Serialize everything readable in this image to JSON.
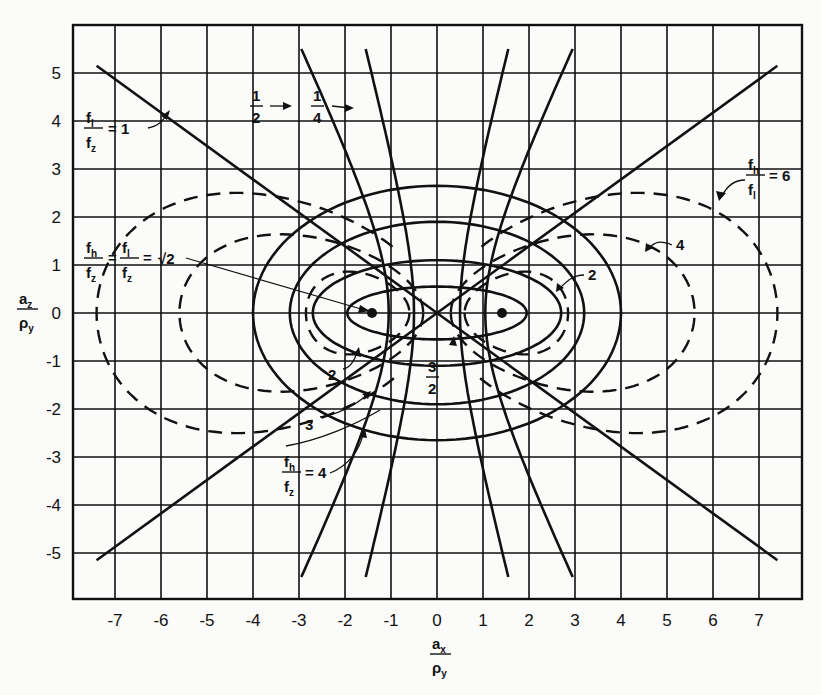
{
  "chart_data": {
    "type": "line",
    "title": "",
    "xlabel": "a_x / ρ_y",
    "ylabel": "a_z / ρ_y",
    "xlim": [
      -7.8,
      7.8
    ],
    "ylim": [
      -6,
      6
    ],
    "grid": true,
    "x_ticks": [
      "-7",
      "-6",
      "-5",
      "-4",
      "-3",
      "-2",
      "-1",
      "0",
      "1",
      "2",
      "3",
      "4",
      "5",
      "6",
      "7"
    ],
    "y_ticks": [
      "5",
      "4",
      "3",
      "2",
      "1",
      "0",
      "-1",
      "-2",
      "-3",
      "-4",
      "-5"
    ],
    "foci": [
      [
        -1.414,
        0
      ],
      [
        1.414,
        0
      ]
    ],
    "series": [
      {
        "name": "f_l/f_z = 1",
        "style": "solid",
        "kind": "line-pair",
        "points": [
          [
            -7.4,
            5.15
          ],
          [
            7.4,
            -5.15
          ]
        ],
        "mirror_points": [
          [
            -7.4,
            -5.15
          ],
          [
            7.4,
            5.15
          ]
        ]
      },
      {
        "name": "f_l/f_z = 1/2",
        "style": "solid",
        "kind": "hyperbola",
        "vertex_x": 1.05,
        "ends": [
          [
            -2.95,
            5.5
          ],
          [
            2.95,
            -5.5
          ]
        ]
      },
      {
        "name": "f_l/f_z = 1/4",
        "style": "solid",
        "kind": "hyperbola",
        "vertex_x": 0.5,
        "ends": [
          [
            -1.55,
            5.5
          ],
          [
            1.5,
            -5.5
          ]
        ]
      },
      {
        "name": "f_h/f_z = 3/2",
        "style": "solid",
        "kind": "ellipse",
        "a": 1.95,
        "b": 0.55
      },
      {
        "name": "f_h/f_z = 2",
        "style": "solid",
        "kind": "ellipse",
        "a": 2.7,
        "b": 1.1
      },
      {
        "name": "f_h/f_z = 3",
        "style": "solid",
        "kind": "ellipse",
        "a": 3.2,
        "b": 1.9
      },
      {
        "name": "f_h/f_z = 4",
        "style": "solid",
        "kind": "ellipse",
        "a": 4.0,
        "b": 2.65
      },
      {
        "name": "f_h/f_l = 2",
        "style": "dashed",
        "kind": "loop-pair",
        "inner_x": 0.6,
        "outer_x": 2.85,
        "half_height": 1.0
      },
      {
        "name": "f_h/f_l = 4",
        "style": "dashed",
        "kind": "loop-pair",
        "inner_x": 0.3,
        "outer_x": 5.6,
        "half_height": 1.9
      },
      {
        "name": "f_h/f_l = 6",
        "style": "dashed",
        "kind": "arc-pair",
        "inner_x": 0.1,
        "outer_x": 7.4,
        "half_height": 2.9
      }
    ],
    "annotations": [
      {
        "text": "f_l/f_z = 1",
        "x": -6.8,
        "y": 4.0
      },
      {
        "text": "1/2",
        "x": -2.6,
        "y": 4.0
      },
      {
        "text": "1/4",
        "x": -1.3,
        "y": 4.0
      },
      {
        "text": "f_h/f_l = 6",
        "x": 6.2,
        "y": 3.0
      },
      {
        "text": "4",
        "x": 5.4,
        "y": 2.0
      },
      {
        "text": "2",
        "x": 3.4,
        "y": 0.6
      },
      {
        "text": "f_h/f_z = f_l/f_z = √2",
        "x": -6.5,
        "y": 1.0
      },
      {
        "text": "2",
        "x": -1.8,
        "y": -1.2
      },
      {
        "text": "3/2",
        "x": 0.2,
        "y": -1.3
      },
      {
        "text": "3",
        "x": -2.8,
        "y": -2.2
      },
      {
        "text": "f_h/f_z = 4",
        "x": -3.5,
        "y": -3.6
      }
    ]
  },
  "labels": {
    "fl_fz_1": {
      "num": "f",
      "num_sub": "l",
      "den": "f",
      "den_sub": "z",
      "eq": "= 1"
    },
    "half": {
      "num": "1",
      "den": "2"
    },
    "quarter": {
      "num": "1",
      "den": "4"
    },
    "fh_fl_6": {
      "num": "f",
      "num_sub": "h",
      "den": "f",
      "den_sub": "l",
      "eq": "= 6"
    },
    "four_right": "4",
    "two_right": "2",
    "sqrt2": {
      "a_num": "f",
      "a_num_sub": "h",
      "a_den": "f",
      "a_den_sub": "z",
      "eq1": "=",
      "b_num": "f",
      "b_num_sub": "l",
      "b_den": "f",
      "b_den_sub": "z",
      "eq2": "=",
      "value": "√2"
    },
    "two_left": "2",
    "three_halves": {
      "num": "3",
      "den": "2"
    },
    "three": "3",
    "fh_fz_4": {
      "num": "f",
      "num_sub": "h",
      "den": "f",
      "den_sub": "z",
      "eq": "= 4"
    },
    "y_axis": {
      "num": "a",
      "num_sub": "z",
      "den": "ρ",
      "den_sub": "y"
    },
    "x_axis": {
      "num": "a",
      "num_sub": "x",
      "den": "ρ",
      "den_sub": "y"
    }
  }
}
